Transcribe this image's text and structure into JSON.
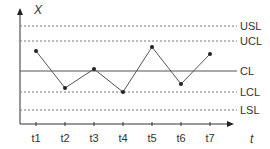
{
  "chart_data": {
    "type": "line",
    "title": "",
    "xlabel": "t",
    "ylabel": "X",
    "categories": [
      "t1",
      "t2",
      "t3",
      "t4",
      "t5",
      "t6",
      "t7"
    ],
    "series": [
      {
        "name": "X",
        "values": [
          20,
          -17,
          2,
          -21,
          24,
          -13,
          17
        ]
      }
    ],
    "reference_lines": [
      {
        "label": "USL",
        "value": 45,
        "style": "dashed"
      },
      {
        "label": "UCL",
        "value": 30,
        "style": "dashed"
      },
      {
        "label": "CL",
        "value": 0,
        "style": "solid"
      },
      {
        "label": "LCL",
        "value": -21,
        "style": "dashed"
      },
      {
        "label": "LSL",
        "value": -39,
        "style": "dashed"
      }
    ],
    "ylim": [
      -53,
      61
    ],
    "grid": false,
    "legend": "none",
    "units_note": "values relative to CL; no numeric y ticks shown"
  },
  "labels": {
    "y_axis": "X",
    "x_axis": "t",
    "usl": "USL",
    "ucl": "UCL",
    "cl": "CL",
    "lcl": "LCL",
    "lsl": "LSL",
    "ticks": [
      "t1",
      "t2",
      "t3",
      "t4",
      "t5",
      "t6",
      "t7"
    ]
  },
  "colors": {
    "axis": "#333333",
    "line": "#555555",
    "marker": "#222222",
    "dashed": "#777777",
    "text": "#333333"
  }
}
